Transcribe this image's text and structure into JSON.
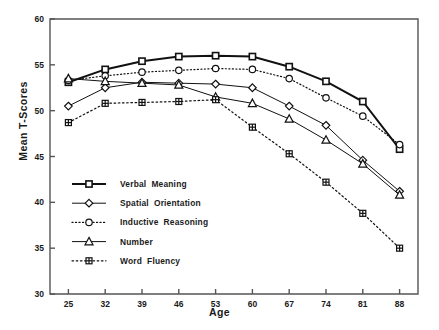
{
  "chart_data": {
    "type": "line",
    "title": "",
    "xlabel": "Age",
    "ylabel": "Mean T-Scores",
    "x": [
      25,
      32,
      39,
      46,
      53,
      60,
      67,
      74,
      81,
      88
    ],
    "xticklabels": [
      "25",
      "32",
      "39",
      "46",
      "53",
      "60",
      "67",
      "74",
      "81",
      "88"
    ],
    "yticklabels": [
      "30",
      "35",
      "40",
      "45",
      "50",
      "55",
      "60"
    ],
    "xlim": [
      21.5,
      91.5
    ],
    "ylim": [
      30,
      60
    ],
    "ytick_step": 5,
    "grid": false,
    "legend_position": "inside-lower-left",
    "series": [
      {
        "name": "Verbal Meaning",
        "marker": "square",
        "linestyle": "solid",
        "linewidth": 2.0,
        "values": [
          53.1,
          54.5,
          55.4,
          55.9,
          56.0,
          55.9,
          54.8,
          53.2,
          51.0,
          45.8
        ]
      },
      {
        "name": "Spatial Orientation",
        "marker": "diamond",
        "linestyle": "solid",
        "linewidth": 1.0,
        "values": [
          50.5,
          52.5,
          53.1,
          53.0,
          52.9,
          52.5,
          50.5,
          48.4,
          44.6,
          41.2
        ]
      },
      {
        "name": "Inductive Reasoning",
        "marker": "circle",
        "linestyle": "dotted",
        "linewidth": 1.2,
        "values": [
          53.3,
          53.8,
          54.2,
          54.4,
          54.6,
          54.5,
          53.5,
          51.4,
          49.4,
          46.3
        ]
      },
      {
        "name": "Number",
        "marker": "triangle",
        "linestyle": "solid",
        "linewidth": 1.0,
        "values": [
          53.5,
          53.2,
          53.0,
          52.8,
          51.5,
          50.8,
          49.1,
          46.8,
          44.2,
          40.8
        ]
      },
      {
        "name": "Word Fluency",
        "marker": "crossbox",
        "linestyle": "dashed",
        "linewidth": 1.2,
        "values": [
          48.7,
          50.8,
          50.9,
          51.0,
          51.2,
          48.2,
          45.3,
          42.2,
          38.8,
          35.0
        ]
      }
    ]
  },
  "axis": {
    "y_label": "Mean T-Scores",
    "x_label": "Age"
  },
  "colors": {
    "line": "#111111",
    "axis": "#555555",
    "text": "#1a1a1a",
    "background": "#ffffff"
  }
}
